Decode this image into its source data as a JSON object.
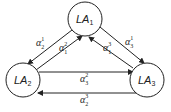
{
  "nodes": [
    {
      "id": "LA1",
      "base": "LA",
      "sub": "1"
    },
    {
      "id": "LA2",
      "base": "LA",
      "sub": "2"
    },
    {
      "id": "LA3",
      "base": "LA",
      "sub": "3"
    }
  ],
  "edges": [
    {
      "from": "LA1",
      "to": "LA2",
      "symbol": "α",
      "sub": "2",
      "sup": "1"
    },
    {
      "from": "LA2",
      "to": "LA1",
      "symbol": "α",
      "sub": "1",
      "sup": "2"
    },
    {
      "from": "LA3",
      "to": "LA1",
      "symbol": "α",
      "sub": "1",
      "sup": "3"
    },
    {
      "from": "LA1",
      "to": "LA3",
      "symbol": "α",
      "sub": "3",
      "sup": "1"
    },
    {
      "from": "LA2",
      "to": "LA3",
      "symbol": "α",
      "sub": "3",
      "sup": "2"
    },
    {
      "from": "LA3",
      "to": "LA2",
      "symbol": "α",
      "sub": "2",
      "sup": "3"
    }
  ]
}
